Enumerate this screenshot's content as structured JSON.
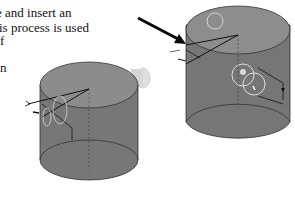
{
  "document": {
    "body_text_lines": [
      "e and insert an",
      "is process is used",
      "f",
      "",
      "n"
    ]
  },
  "figures": {
    "left": {
      "description": "Gray cylinder with sketch lines on top face and a small boss on the right side",
      "body_color": "#7a7a7a",
      "top_color": "#8a8a8a",
      "boss_color": "#d8d8d8",
      "line_color": "#111111"
    },
    "right": {
      "description": "Gray cylinder with highlighted circles, sketch lines and a pointer arrow",
      "body_color": "#7a7a7a",
      "top_color": "#8a8a8a",
      "highlight_color": "#e8e8e8",
      "arrow_color": "#0a0a0a"
    }
  }
}
